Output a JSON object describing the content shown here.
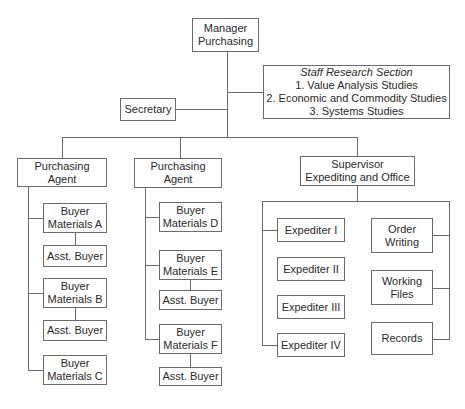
{
  "chart": {
    "manager": {
      "line1": "Manager",
      "line2": "Purchasing"
    },
    "staff": {
      "title": "Staff Research Section",
      "items": [
        "1. Value Analysis Studies",
        "2. Economic and Commodity Studies",
        "3. Systems Studies"
      ]
    },
    "secretary": {
      "label": "Secretary"
    },
    "agent1": {
      "line1": "Purchasing",
      "line2": "Agent",
      "buyers": [
        {
          "line1": "Buyer",
          "line2": "Materials A",
          "assistant": "Asst. Buyer"
        },
        {
          "line1": "Buyer",
          "line2": "Materials B",
          "assistant": "Asst. Buyer"
        },
        {
          "line1": "Buyer",
          "line2": "Materials C"
        }
      ]
    },
    "agent2": {
      "line1": "Purchasing",
      "line2": "Agent",
      "buyers": [
        {
          "line1": "Buyer",
          "line2": "Materials D"
        },
        {
          "line1": "Buyer",
          "line2": "Materials E",
          "assistant": "Asst. Buyer"
        },
        {
          "line1": "Buyer",
          "line2": "Materials F",
          "assistant": "Asst. Buyer"
        }
      ]
    },
    "supervisor": {
      "line1": "Supervisor",
      "line2": "Expediting and Office",
      "expediters": [
        "Expediter I",
        "Expediter II",
        "Expediter III",
        "Expediter IV"
      ],
      "office": [
        {
          "line1": "Order",
          "line2": "Writing"
        },
        {
          "line1": "Working",
          "line2": "Files"
        },
        {
          "line1": "Records"
        }
      ]
    }
  },
  "colors": {
    "line": "#6b6b6b",
    "text": "#2a2a2a",
    "background": "#ffffff"
  }
}
